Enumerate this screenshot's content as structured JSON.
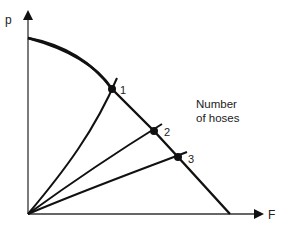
{
  "axes": {
    "y_label": "p",
    "x_label": "F"
  },
  "annotation": {
    "line1": "Number",
    "line2": "of hoses"
  },
  "points": [
    {
      "label": "1"
    },
    {
      "label": "2"
    },
    {
      "label": "3"
    }
  ],
  "colors": {
    "stroke": "#111111",
    "axis": "#333333"
  }
}
